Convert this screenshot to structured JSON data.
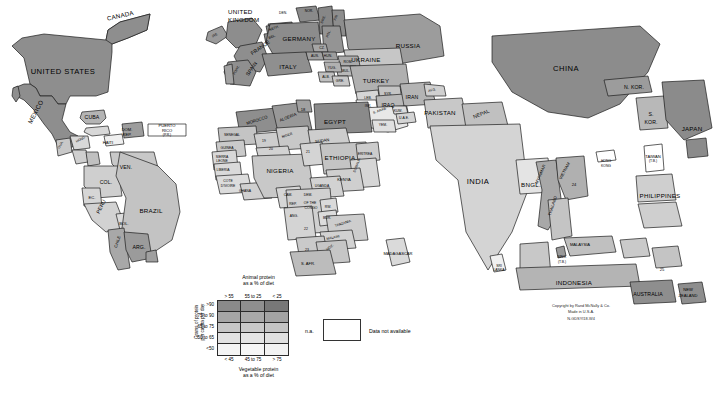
{
  "map": {
    "title": "World protein consumption cartogram",
    "publisher_block": {
      "line1": "Copyright by Rand McNally & Co.",
      "line2": "Made in U.S.A.",
      "line3": "N-GDSYI18-W4"
    }
  },
  "legend": {
    "top_title_line1": "Animal protein",
    "top_title_line2": "as a % of diet",
    "column_labels": [
      "> 55",
      "55 to 25",
      "< 25"
    ],
    "row_labels": [
      ">90",
      "75 to 90",
      "65 to 75",
      "50 to 65",
      "<50"
    ],
    "vertical_axis_line1": "Grams of protein",
    "vertical_axis_line2": "per capita per day",
    "bottom_title_line1": "Vegetable protein",
    "bottom_title_line2": "as a % of diet",
    "swatch_colors": [
      [
        "#8a8a8a",
        "#8f8f8f",
        "#787878"
      ],
      [
        "#a6a6a6",
        "#a9a9a9",
        "#a3a3a3"
      ],
      [
        "#c6c6c6",
        "#c9c9c9",
        "#c4c4c4"
      ],
      [
        "#e2e2e2",
        "#e4e4e4",
        "#e0e0e0"
      ],
      [
        "#f4f4f4",
        "#f6f6f6",
        "#f2f2f2"
      ]
    ],
    "na_code": "n.a.",
    "na_text": "Data not available",
    "na_fill": "#ffffff"
  },
  "chart_data": {
    "type": "map",
    "legend_axes": {
      "x": "Vegetable protein as a % of diet",
      "y": "Grams of protein per capita per day",
      "secondary": "Animal protein as a % of diet"
    }
  },
  "countries": [
    {
      "name": "CANADA",
      "x": 120,
      "y": 16,
      "cls": "lbl med c",
      "rot": -13
    },
    {
      "name": "UNITED STATES",
      "x": 63,
      "y": 68,
      "cls": "lbl big c",
      "rot": 0
    },
    {
      "name": "MEXICO",
      "x": 40,
      "y": 122,
      "cls": "lbl med c",
      "rot": -62
    },
    {
      "name": "CUBA",
      "x": 92,
      "y": 115,
      "cls": "lbl c",
      "rot": 0
    },
    {
      "name": "HAITI",
      "x": 108,
      "y": 141,
      "cls": "lbl tiny c",
      "rot": 0
    },
    {
      "name": "DOM.",
      "x": 127,
      "y": 128,
      "cls": "lbl tiny c",
      "rot": 0
    },
    {
      "name": "REP.",
      "x": 127,
      "y": 133,
      "cls": "lbl tiny c",
      "rot": 0
    },
    {
      "name": "PUERTO",
      "x": 167,
      "y": 124,
      "cls": "lbl tiny c",
      "rot": 0
    },
    {
      "name": "RICO",
      "x": 167,
      "y": 129,
      "cls": "lbl tiny c",
      "rot": 0
    },
    {
      "name": "(P.R.)",
      "x": 167,
      "y": 134,
      "cls": "lbl xtiny c",
      "rot": 0
    },
    {
      "name": "GUA.",
      "x": 62,
      "y": 148,
      "cls": "lbl xtiny c",
      "rot": -62
    },
    {
      "name": "HOND.",
      "x": 81,
      "y": 141,
      "cls": "lbl xtiny c",
      "rot": -28
    },
    {
      "name": "VEN.",
      "x": 126,
      "y": 165,
      "cls": "lbl c",
      "rot": 0
    },
    {
      "name": "COL.",
      "x": 106,
      "y": 180,
      "cls": "lbl c",
      "rot": 0
    },
    {
      "name": "EC.",
      "x": 92,
      "y": 196,
      "cls": "lbl tiny c",
      "rot": 0
    },
    {
      "name": "PERU",
      "x": 103,
      "y": 212,
      "cls": "lbl c",
      "rot": -62
    },
    {
      "name": "BOL.",
      "x": 124,
      "y": 222,
      "cls": "lbl tiny c",
      "rot": 0
    },
    {
      "name": "BRAZIL",
      "x": 151,
      "y": 208,
      "cls": "lbl med c",
      "rot": 0
    },
    {
      "name": "CHILE",
      "x": 120,
      "y": 247,
      "cls": "lbl tiny c",
      "rot": -72
    },
    {
      "name": "ARG.",
      "x": 139,
      "y": 245,
      "cls": "lbl c",
      "rot": 0
    },
    {
      "name": "UNITED",
      "x": 228,
      "y": 9,
      "cls": "lbl med",
      "rot": 0
    },
    {
      "name": "KINGDOM",
      "x": 228,
      "y": 17,
      "cls": "lbl med",
      "rot": 0
    },
    {
      "name": "IRE.",
      "x": 215,
      "y": 36,
      "cls": "lbl xtiny c",
      "rot": -30
    },
    {
      "name": "DEN.",
      "x": 283,
      "y": 12,
      "cls": "lbl xtiny c",
      "rot": 0
    },
    {
      "name": "NOR.",
      "x": 309,
      "y": 10,
      "cls": "lbl xtiny c",
      "rot": 0
    },
    {
      "name": "SWE.",
      "x": 325,
      "y": 23,
      "cls": "lbl xtiny c",
      "rot": -68
    },
    {
      "name": "FIN.",
      "x": 337,
      "y": 20,
      "cls": "lbl xtiny c",
      "rot": -68
    },
    {
      "name": "NETH.",
      "x": 274,
      "y": 29,
      "cls": "lbl xtiny c",
      "rot": -20
    },
    {
      "name": "BEL.",
      "x": 272,
      "y": 37,
      "cls": "lbl xtiny c",
      "rot": -20
    },
    {
      "name": "GERMANY",
      "x": 299,
      "y": 36,
      "cls": "lbl med c",
      "rot": 0
    },
    {
      "name": "POL.",
      "x": 330,
      "y": 37,
      "cls": "lbl xtiny c",
      "rot": -68
    },
    {
      "name": "RUSSIA",
      "x": 408,
      "y": 43,
      "cls": "lbl med c",
      "rot": 0
    },
    {
      "name": "UKRAINE",
      "x": 366,
      "y": 57,
      "cls": "lbl med c",
      "rot": 0
    },
    {
      "name": "FRANCE",
      "x": 261,
      "y": 52,
      "cls": "lbl c",
      "rot": -35
    },
    {
      "name": "ITALY",
      "x": 288,
      "y": 64,
      "cls": "lbl med c",
      "rot": 0
    },
    {
      "name": "SPAIN",
      "x": 253,
      "y": 74,
      "cls": "lbl c",
      "rot": -55
    },
    {
      "name": "PORT.",
      "x": 238,
      "y": 74,
      "cls": "lbl xtiny c",
      "rot": -60
    },
    {
      "name": "CZ.",
      "x": 322,
      "y": 47,
      "cls": "lbl xtiny c",
      "rot": 0
    },
    {
      "name": "AUS.",
      "x": 315,
      "y": 55,
      "cls": "lbl xtiny c",
      "rot": 0
    },
    {
      "name": "HUN.",
      "x": 328,
      "y": 55,
      "cls": "lbl xtiny c",
      "rot": 0
    },
    {
      "name": "ROM.",
      "x": 348,
      "y": 61,
      "cls": "lbl xtiny c",
      "rot": 0
    },
    {
      "name": "BUL.",
      "x": 346,
      "y": 70,
      "cls": "lbl xtiny c",
      "rot": 0
    },
    {
      "name": "YUG.",
      "x": 332,
      "y": 67,
      "cls": "lbl xtiny c",
      "rot": 0
    },
    {
      "name": "ALB.",
      "x": 326,
      "y": 76,
      "cls": "lbl xtiny c",
      "rot": 0
    },
    {
      "name": "GRE.",
      "x": 340,
      "y": 80,
      "cls": "lbl xtiny c",
      "rot": 0
    },
    {
      "name": "TURKEY",
      "x": 376,
      "y": 78,
      "cls": "lbl med c",
      "rot": 0
    },
    {
      "name": "LEB.",
      "x": 368,
      "y": 97,
      "cls": "lbl xtiny c",
      "rot": 0
    },
    {
      "name": "SYR.",
      "x": 388,
      "y": 93,
      "cls": "lbl xtiny c",
      "rot": 0
    },
    {
      "name": "ISR.",
      "x": 368,
      "y": 105,
      "cls": "lbl xtiny c",
      "rot": 0
    },
    {
      "name": "IRAQ",
      "x": 388,
      "y": 103,
      "cls": "lbl c",
      "rot": 0
    },
    {
      "name": "IRAN",
      "x": 412,
      "y": 95,
      "cls": "lbl c",
      "rot": 0
    },
    {
      "name": "AFG.",
      "x": 432,
      "y": 90,
      "cls": "lbl xtiny c",
      "rot": -12
    },
    {
      "name": "PAKISTAN",
      "x": 440,
      "y": 110,
      "cls": "lbl med c",
      "rot": 0
    },
    {
      "name": "NEPAL",
      "x": 481,
      "y": 115,
      "cls": "lbl c",
      "rot": -22
    },
    {
      "name": "INDIA",
      "x": 478,
      "y": 178,
      "cls": "lbl big c",
      "rot": 0
    },
    {
      "name": "BNGL.",
      "x": 531,
      "y": 182,
      "cls": "lbl med c",
      "rot": 0
    },
    {
      "name": "SRI",
      "x": 499,
      "y": 265,
      "cls": "lbl xtiny c",
      "rot": 0
    },
    {
      "name": "LANKA",
      "x": 499,
      "y": 269,
      "cls": "lbl xtiny c",
      "rot": 0
    },
    {
      "name": "S. ARAB.",
      "x": 380,
      "y": 112,
      "cls": "lbl xtiny c",
      "rot": -20
    },
    {
      "name": "KUW.",
      "x": 398,
      "y": 110,
      "cls": "lbl xtiny c",
      "rot": 0
    },
    {
      "name": "U.A.E.",
      "x": 404,
      "y": 117,
      "cls": "lbl xtiny c",
      "rot": 0
    },
    {
      "name": "YEM.",
      "x": 383,
      "y": 124,
      "cls": "lbl xtiny c",
      "rot": 0
    },
    {
      "name": "CHINA",
      "x": 566,
      "y": 65,
      "cls": "lbl big c",
      "rot": 0
    },
    {
      "name": "N. KOR.",
      "x": 634,
      "y": 85,
      "cls": "lbl c",
      "rot": 0
    },
    {
      "name": "S.",
      "x": 651,
      "y": 112,
      "cls": "lbl c",
      "rot": 0
    },
    {
      "name": "KOR.",
      "x": 651,
      "y": 120,
      "cls": "lbl c",
      "rot": 0
    },
    {
      "name": "JAPAN",
      "x": 692,
      "y": 126,
      "cls": "lbl med c",
      "rot": 0
    },
    {
      "name": "TAIWAN",
      "x": 653,
      "y": 155,
      "cls": "lbl tiny c",
      "rot": 0
    },
    {
      "name": "(T.B.)",
      "x": 653,
      "y": 160,
      "cls": "lbl xtiny c",
      "rot": 0
    },
    {
      "name": "HONG",
      "x": 606,
      "y": 160,
      "cls": "lbl xtiny c",
      "rot": 0
    },
    {
      "name": "KONG",
      "x": 606,
      "y": 165,
      "cls": "lbl xtiny c",
      "rot": 0
    },
    {
      "name": "MYANMAR",
      "x": 545,
      "y": 183,
      "cls": "lbl tiny c",
      "rot": -66
    },
    {
      "name": "VIETNAM",
      "x": 568,
      "y": 178,
      "cls": "lbl tiny c",
      "rot": -62
    },
    {
      "name": "24",
      "x": 574,
      "y": 183,
      "cls": "lbl tiny c",
      "rot": 0
    },
    {
      "name": "THAILAND",
      "x": 558,
      "y": 215,
      "cls": "lbl tiny c",
      "rot": -72
    },
    {
      "name": "MALAYSIA",
      "x": 580,
      "y": 243,
      "cls": "lbl tiny c",
      "rot": 0
    },
    {
      "name": "SING.",
      "x": 562,
      "y": 256,
      "cls": "lbl xtiny c",
      "rot": 0
    },
    {
      "name": "(T.B.)",
      "x": 562,
      "y": 261,
      "cls": "lbl xtiny c",
      "rot": 0
    },
    {
      "name": "INDONESIA",
      "x": 574,
      "y": 280,
      "cls": "lbl med c",
      "rot": 0
    },
    {
      "name": "PHILIPPINES",
      "x": 660,
      "y": 193,
      "cls": "lbl med c",
      "rot": 0
    },
    {
      "name": "25",
      "x": 662,
      "y": 268,
      "cls": "lbl tiny c",
      "rot": 0
    },
    {
      "name": "AUSTRALIA",
      "x": 648,
      "y": 292,
      "cls": "lbl c",
      "rot": 0
    },
    {
      "name": "NEW",
      "x": 688,
      "y": 288,
      "cls": "lbl tiny c",
      "rot": 0
    },
    {
      "name": "ZEALAND",
      "x": 688,
      "y": 294,
      "cls": "lbl tiny c",
      "rot": 0
    },
    {
      "name": "MOROCCO",
      "x": 257,
      "y": 122,
      "cls": "lbl tiny c",
      "rot": -18
    },
    {
      "name": "ALGERIA",
      "x": 288,
      "y": 119,
      "cls": "lbl tiny c",
      "rot": -22
    },
    {
      "name": "18",
      "x": 303,
      "y": 108,
      "cls": "lbl tiny c",
      "rot": 0
    },
    {
      "name": "EGYPT",
      "x": 335,
      "y": 119,
      "cls": "lbl med c",
      "rot": 0
    },
    {
      "name": "SENEGAL",
      "x": 232,
      "y": 134,
      "cls": "lbl xtiny c",
      "rot": 0
    },
    {
      "name": "GUINEA",
      "x": 227,
      "y": 147,
      "cls": "lbl xtiny c",
      "rot": 0
    },
    {
      "name": "SIERRA",
      "x": 222,
      "y": 156,
      "cls": "lbl xtiny c",
      "rot": 0
    },
    {
      "name": "LEONE",
      "x": 222,
      "y": 160,
      "cls": "lbl xtiny c",
      "rot": 0
    },
    {
      "name": "LIBERIA",
      "x": 223,
      "y": 169,
      "cls": "lbl xtiny c",
      "rot": 0
    },
    {
      "name": "COTE",
      "x": 228,
      "y": 180,
      "cls": "lbl xtiny c",
      "rot": 0
    },
    {
      "name": "D'IVOIRE",
      "x": 228,
      "y": 185,
      "cls": "lbl xtiny c",
      "rot": 0
    },
    {
      "name": "GHANA",
      "x": 245,
      "y": 190,
      "cls": "lbl xtiny c",
      "rot": 0
    },
    {
      "name": "19",
      "x": 264,
      "y": 140,
      "cls": "lbl xtiny c",
      "rot": 0
    },
    {
      "name": "NIGER",
      "x": 287,
      "y": 136,
      "cls": "lbl xtiny c",
      "rot": -18
    },
    {
      "name": "20",
      "x": 271,
      "y": 148,
      "cls": "lbl xtiny c",
      "rot": 0
    },
    {
      "name": "NIGERIA",
      "x": 280,
      "y": 168,
      "cls": "lbl med c",
      "rot": 0
    },
    {
      "name": "SUDAN",
      "x": 322,
      "y": 140,
      "cls": "lbl tiny c",
      "rot": -8
    },
    {
      "name": "21",
      "x": 308,
      "y": 151,
      "cls": "lbl xtiny c",
      "rot": 0
    },
    {
      "name": "ETHIOPIA",
      "x": 340,
      "y": 155,
      "cls": "lbl med c",
      "rot": 0
    },
    {
      "name": "ERITREA",
      "x": 365,
      "y": 153,
      "cls": "lbl xtiny c",
      "rot": 0
    },
    {
      "name": "SOMALIA",
      "x": 361,
      "y": 172,
      "cls": "lbl xtiny c",
      "rot": -70
    },
    {
      "name": "KENYA",
      "x": 344,
      "y": 178,
      "cls": "lbl tiny c",
      "rot": 0
    },
    {
      "name": "UGANDA",
      "x": 322,
      "y": 185,
      "cls": "lbl xtiny c",
      "rot": 0
    },
    {
      "name": "CAM.",
      "x": 288,
      "y": 194,
      "cls": "lbl xtiny c",
      "rot": 0
    },
    {
      "name": "DEM.",
      "x": 308,
      "y": 194,
      "cls": "lbl xtiny c",
      "rot": 0
    },
    {
      "name": "REP.",
      "x": 293,
      "y": 203,
      "cls": "lbl xtiny c",
      "rot": 0
    },
    {
      "name": "OF THE",
      "x": 310,
      "y": 202,
      "cls": "lbl xtiny c",
      "rot": 0
    },
    {
      "name": "CONGO",
      "x": 311,
      "y": 207,
      "cls": "lbl xtiny c",
      "rot": 0
    },
    {
      "name": "RW.",
      "x": 328,
      "y": 206,
      "cls": "lbl xtiny c",
      "rot": 0
    },
    {
      "name": "BUR.",
      "x": 327,
      "y": 217,
      "cls": "lbl xtiny c",
      "rot": 0
    },
    {
      "name": "ANG.",
      "x": 294,
      "y": 215,
      "cls": "lbl xtiny c",
      "rot": 0
    },
    {
      "name": "22",
      "x": 306,
      "y": 228,
      "cls": "lbl xtiny c",
      "rot": 0
    },
    {
      "name": "TANZANIA",
      "x": 343,
      "y": 225,
      "cls": "lbl xtiny c",
      "rot": -18
    },
    {
      "name": "MALAWI",
      "x": 333,
      "y": 238,
      "cls": "lbl xtiny c",
      "rot": -12
    },
    {
      "name": "23",
      "x": 307,
      "y": 249,
      "cls": "lbl xtiny c",
      "rot": 0
    },
    {
      "name": "MOZ.",
      "x": 330,
      "y": 249,
      "cls": "lbl xtiny c",
      "rot": -35
    },
    {
      "name": "S. AFR.",
      "x": 308,
      "y": 262,
      "cls": "lbl tiny c",
      "rot": 0
    },
    {
      "name": "MADAGASCAR",
      "x": 398,
      "y": 252,
      "cls": "lbl tiny c",
      "rot": 0
    }
  ]
}
